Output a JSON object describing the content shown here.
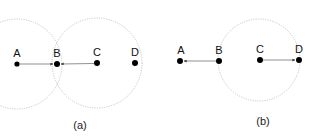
{
  "panels": [
    {
      "caption": "(a)",
      "nodes": [
        {
          "label": "A",
          "x": 17,
          "y": 64
        },
        {
          "label": "B",
          "x": 57,
          "y": 64
        },
        {
          "label": "C",
          "x": 97,
          "y": 63
        },
        {
          "label": "D",
          "x": 135,
          "y": 63
        }
      ],
      "ranges": [
        {
          "center": "A",
          "r": 45
        },
        {
          "center": "C",
          "r": 45
        }
      ],
      "arrows": [
        {
          "from": "A",
          "to": "B"
        },
        {
          "from": "C",
          "to": "B"
        }
      ]
    },
    {
      "caption": "(b)",
      "nodes": [
        {
          "label": "A",
          "x": 180,
          "y": 61
        },
        {
          "label": "B",
          "x": 219,
          "y": 61
        },
        {
          "label": "C",
          "x": 260,
          "y": 60
        },
        {
          "label": "D",
          "x": 299,
          "y": 60
        }
      ],
      "ranges": [
        {
          "center": "C",
          "r": 41
        }
      ],
      "arrows": [
        {
          "from": "B",
          "to": "A"
        },
        {
          "from": "C",
          "to": "D"
        }
      ]
    }
  ],
  "colors": {
    "node": "#000000",
    "circle": "#bbbbbb",
    "arrow": "#444444"
  }
}
